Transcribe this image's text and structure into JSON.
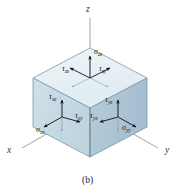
{
  "figure": {
    "caption": "(b)",
    "background_color": "#ffffff",
    "description_type": "3d-stress-element-cube"
  },
  "axes": [
    {
      "name": "z",
      "label": "z",
      "direction": "up",
      "x": 88,
      "y": 8
    },
    {
      "name": "x",
      "label": "x",
      "direction": "lower-left",
      "x": 8,
      "y": 150
    },
    {
      "name": "y",
      "label": "y",
      "direction": "lower-right",
      "x": 166,
      "y": 150
    }
  ],
  "faces": {
    "top": {
      "name": "top-face",
      "normal": "z",
      "fill": "#e8f1f5",
      "labels": [
        {
          "symbol": "σ",
          "sub": "zz",
          "x": 96,
          "y": 52,
          "arrow": "up"
        },
        {
          "symbol": "τ",
          "sub": "zx",
          "x": 69,
          "y": 70,
          "arrow": "left"
        },
        {
          "symbol": "τ",
          "sub": "zy",
          "x": 101,
          "y": 70,
          "arrow": "right"
        }
      ]
    },
    "left": {
      "name": "left-face",
      "normal": "x",
      "fill": "#c5d8e2",
      "labels": [
        {
          "symbol": "τ",
          "sub": "xz",
          "x": 56,
          "y": 97,
          "arrow": "up"
        },
        {
          "symbol": "τ",
          "sub": "xy",
          "x": 76,
          "y": 117,
          "arrow": "right"
        },
        {
          "symbol": "σ",
          "sub": "xx",
          "x": 42,
          "y": 131,
          "arrow": "lower-left"
        }
      ]
    },
    "right": {
      "name": "right-face",
      "normal": "y",
      "fill": "#aec6d4",
      "labels": [
        {
          "symbol": "τ",
          "sub": "yz",
          "x": 110,
          "y": 100,
          "arrow": "up"
        },
        {
          "symbol": "τ",
          "sub": "yx",
          "x": 94,
          "y": 116,
          "arrow": "left"
        },
        {
          "symbol": "σ",
          "sub": "yy",
          "x": 126,
          "y": 128,
          "arrow": "lower-right"
        }
      ]
    }
  },
  "colors": {
    "top_face": "#e8f1f5",
    "left_face": "#c5d8e2",
    "right_face": "#aec6d4",
    "edge": "#6f8a99",
    "axis_line": "#8a8a8a",
    "arrow": "#111111",
    "background": "#ffffff"
  }
}
